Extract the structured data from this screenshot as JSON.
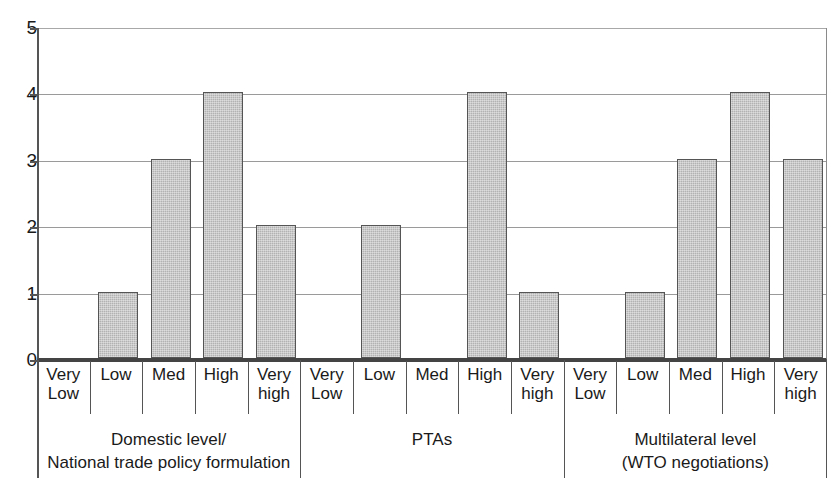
{
  "chart_data": {
    "type": "bar",
    "title": "",
    "xlabel": "",
    "ylabel": "",
    "ylim": [
      0,
      5
    ],
    "yticks": [
      "0",
      "1",
      "2",
      "3",
      "4",
      "5"
    ],
    "grid": true,
    "legend": "none",
    "categories": [
      "Very Low",
      "Low",
      "Med",
      "High",
      "Very high",
      "Very Low",
      "Low",
      "Med",
      "High",
      "Very high",
      "Very Low",
      "Low",
      "Med",
      "High",
      "Very high"
    ],
    "values": [
      0,
      1,
      3,
      4,
      2,
      0,
      2,
      0,
      4,
      1,
      0,
      1,
      3,
      4,
      3
    ],
    "groups": [
      {
        "label_line1": "Domestic level/",
        "label_line2": "National trade policy formulation",
        "categories": [
          "Very Low",
          "Low",
          "Med",
          "High",
          "Very high"
        ],
        "values": [
          0,
          1,
          3,
          4,
          2
        ]
      },
      {
        "label_line1": "PTAs",
        "label_line2": "",
        "categories": [
          "Very Low",
          "Low",
          "Med",
          "High",
          "Very high"
        ],
        "values": [
          0,
          2,
          0,
          4,
          1
        ]
      },
      {
        "label_line1": "Multilateral level",
        "label_line2": "(WTO negotiations)",
        "categories": [
          "Very Low",
          "Low",
          "Med",
          "High",
          "Very high"
        ],
        "values": [
          0,
          1,
          3,
          4,
          3
        ]
      }
    ],
    "cat_lines": [
      [
        "Very",
        "Low"
      ],
      [
        "Low",
        ""
      ],
      [
        "Med",
        ""
      ],
      [
        "High",
        ""
      ],
      [
        "Very",
        "high"
      ],
      [
        "Very",
        "Low"
      ],
      [
        "Low",
        ""
      ],
      [
        "Med",
        ""
      ],
      [
        "High",
        ""
      ],
      [
        "Very",
        "high"
      ],
      [
        "Very",
        "Low"
      ],
      [
        "Low",
        ""
      ],
      [
        "Med",
        ""
      ],
      [
        "High",
        ""
      ],
      [
        "Very",
        "high"
      ]
    ],
    "colors": {
      "bar_fill": "#b2b2b2",
      "bar_border": "#555555",
      "axis": "#444444",
      "gridline": "#9a9a9a",
      "text": "#1a1a1a",
      "background": "#ffffff"
    }
  }
}
